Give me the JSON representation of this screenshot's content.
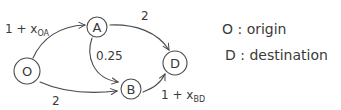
{
  "diagram": {
    "type": "directed-network",
    "nodes": [
      {
        "id": "O",
        "label": "O",
        "cx": 27,
        "cy": 71,
        "r": 13
      },
      {
        "id": "A",
        "label": "A",
        "cx": 97,
        "cy": 27,
        "r": 10
      },
      {
        "id": "B",
        "label": "B",
        "cx": 131,
        "cy": 89,
        "r": 10
      },
      {
        "id": "D",
        "label": "D",
        "cx": 175,
        "cy": 63,
        "r": 12
      }
    ],
    "edges": [
      {
        "from": "O",
        "to": "A",
        "label_main": "1 + x",
        "label_sub": "OA"
      },
      {
        "from": "A",
        "to": "D",
        "label_main": "2",
        "label_sub": ""
      },
      {
        "from": "A",
        "to": "B",
        "label_main": "0.25",
        "label_sub": ""
      },
      {
        "from": "O",
        "to": "B",
        "label_main": "2",
        "label_sub": ""
      },
      {
        "from": "B",
        "to": "D",
        "label_main": "1 + x",
        "label_sub": "BD"
      }
    ],
    "legend": [
      {
        "text": "O : origin"
      },
      {
        "text": "D : destination"
      }
    ],
    "colors": {
      "ink": "#4a4a4a",
      "background": "#ffffff"
    }
  }
}
